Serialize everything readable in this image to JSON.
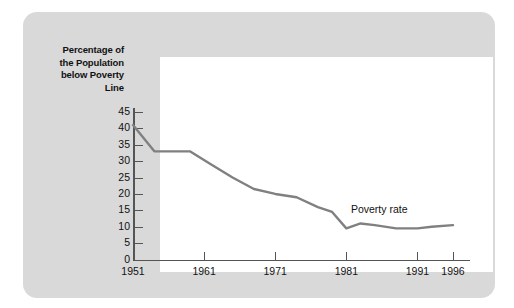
{
  "chart_data": {
    "type": "line",
    "title": "",
    "xlabel": "",
    "ylabel": "Percentage of the Population below Poverty Line",
    "xlim": [
      1951,
      1996
    ],
    "ylim": [
      0,
      45
    ],
    "grid": false,
    "legend_position": "inline-annotation",
    "x_tick_labels": [
      "1951",
      "1961",
      "1971",
      "1981",
      "1991",
      "1996"
    ],
    "x_ticks": [
      1951,
      1961,
      1971,
      1981,
      1991,
      1996
    ],
    "y_tick_labels": [
      "0",
      "5",
      "10",
      "15",
      "20",
      "25",
      "30",
      "35",
      "40",
      "45"
    ],
    "y_ticks": [
      0,
      5,
      10,
      15,
      20,
      25,
      30,
      35,
      40,
      45
    ],
    "series": [
      {
        "name": "Poverty rate",
        "color": "#808080",
        "x": [
          1951,
          1954,
          1959,
          1962,
          1965,
          1968,
          1971,
          1974,
          1977,
          1979,
          1981,
          1983,
          1985,
          1988,
          1991,
          1993,
          1996
        ],
        "values": [
          41,
          33,
          33,
          29,
          25,
          21.5,
          20,
          19,
          16,
          14.5,
          9.5,
          11,
          10.5,
          9.5,
          9.5,
          10,
          10.5
        ]
      }
    ],
    "annotations": [
      {
        "text": "Poverty rate",
        "x": 1986,
        "y": 15
      }
    ]
  },
  "axis": {
    "y_title_line1": "Percentage of",
    "y_title_line2": "the Population",
    "y_title_line3": "below Poverty",
    "y_title_line4": "Line"
  },
  "colors": {
    "card_background": "#d9d9d9",
    "plot_background": "#ffffff",
    "axis": "#555555",
    "series": "#808080",
    "text": "#111111"
  }
}
